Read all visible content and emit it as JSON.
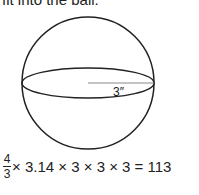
{
  "top_text": "fit into the ball.",
  "figure": {
    "shape": "sphere",
    "radius_label": "3″",
    "stroke_color": "#222222",
    "radius_line_color": "#888888"
  },
  "equation": {
    "fraction_numerator": "4",
    "fraction_denominator": "3",
    "expression": "× 3.14 × 3 × 3 × 3 = 113"
  }
}
